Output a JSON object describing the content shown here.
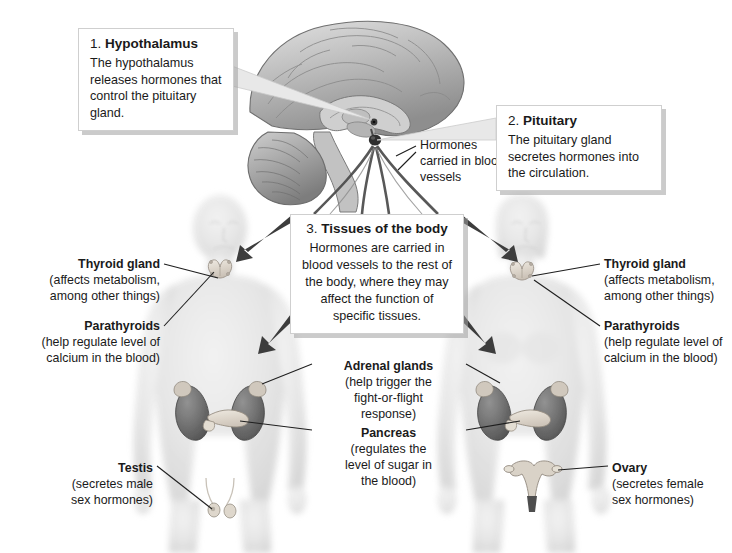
{
  "diagram": {
    "type": "anatomical-illustration",
    "background_color": "#ffffff",
    "text_color": "#1a1a1a"
  },
  "callouts": [
    {
      "number": "1.",
      "name": "Hypothalamus",
      "body": "The hypothalamus releases hormones that control the pituitary gland."
    },
    {
      "number": "2.",
      "name": "Pituitary",
      "body": "The pituitary gland secretes hormones into the circulation."
    },
    {
      "number": "3.",
      "name": "Tissues of the body",
      "body": "Hormones are carried in blood vessels to the rest of the body, where they may affect the function of specific tissues."
    }
  ],
  "annotations": {
    "vessels": "Hormones carried in blood vessels"
  },
  "organ_labels": {
    "thyroid_left": {
      "heading": "Thyroid gland",
      "detail_line_1": "(affects metabolism,",
      "detail_line_2": "among other things)"
    },
    "parathyroids_left": {
      "heading": "Parathyroids",
      "detail_line_1": "(help regulate level of",
      "detail_line_2": "calcium in the blood)"
    },
    "testis": {
      "heading": "Testis",
      "detail_line_1": "(secretes male",
      "detail_line_2": "sex hormones)"
    },
    "thyroid_right": {
      "heading": "Thyroid gland",
      "detail_line_1": "(affects metabolism,",
      "detail_line_2": "among other things)"
    },
    "parathyroids_right": {
      "heading": "Parathyroids",
      "detail_line_1": "(help regulate level of",
      "detail_line_2": "calcium in the blood)"
    },
    "ovary": {
      "heading": "Ovary",
      "detail_line_1": "(secretes female",
      "detail_line_2": "sex hormones)"
    },
    "adrenal_glands": {
      "heading": "Adrenal glands",
      "detail_line_1": "(help trigger the",
      "detail_line_2": "fight-or-flight",
      "detail_line_3": "response)"
    },
    "pancreas": {
      "heading": "Pancreas",
      "detail_line_1": "(regulates the",
      "detail_line_2": "level of sugar in",
      "detail_line_3": "the blood)"
    }
  },
  "figures": {
    "male": "male-body-silhouette",
    "female": "female-body-silhouette",
    "brain": "sagittal-brain-section"
  }
}
